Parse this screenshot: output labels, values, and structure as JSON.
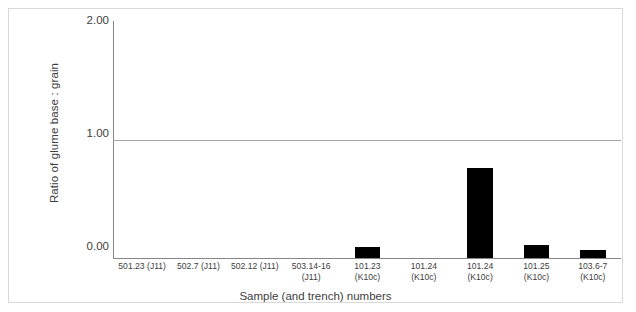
{
  "chart_data": {
    "type": "bar",
    "title": "",
    "xlabel": "Sample (and trench) numbers",
    "ylabel": "Ratio of glume base : grain",
    "ylim": [
      0,
      2
    ],
    "yticks": [
      "0.00",
      "1.00",
      "2.00"
    ],
    "ytick_values": [
      0,
      1,
      2
    ],
    "grid": "horizontal gridline at 1.00",
    "legend": "none",
    "bar_color": "#000000",
    "categories": [
      "501.23 (J11)",
      "502.7 (J11)",
      "502.12 (J11)",
      "503.14-16\n(J11)",
      "101.23\n(K10c)",
      "101.24\n(K10c)",
      "101.24\n(K10c)",
      "101.25\n(K10c)",
      "103.6-7\n(K10c)"
    ],
    "values": [
      0,
      0,
      0,
      0,
      0.09,
      0,
      0.76,
      0.11,
      0.07
    ]
  },
  "axes": {
    "y_title": "Ratio of glume base : grain",
    "x_title": "Sample (and trench) numbers",
    "y_tick_0": "0.00",
    "y_tick_1": "1.00",
    "y_tick_2": "2.00"
  },
  "caption": {
    "text": ""
  },
  "colors": {
    "bar": "#000000",
    "axis": "#868686",
    "gridline": "#a6a6a6",
    "frame": "#d9d9d9",
    "text": "#404040"
  }
}
